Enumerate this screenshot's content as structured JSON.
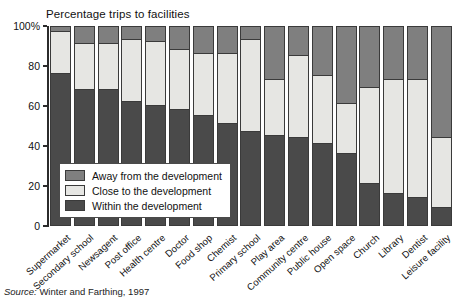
{
  "chart_data": {
    "type": "bar",
    "subtype": "stacked-bar-100-percent",
    "title": "Percentage trips to facilities",
    "xlabel": "",
    "ylabel": "",
    "ylim": [
      0,
      100
    ],
    "yticks": [
      0,
      20,
      40,
      60,
      80,
      100
    ],
    "ytick_labels": [
      "0",
      "20",
      "40",
      "60",
      "80",
      "100%"
    ],
    "grid": false,
    "legend_position": "inside-lower-left",
    "orientation": "vertical",
    "categories": [
      "Supermarket",
      "Secondary school",
      "Newsagent",
      "Post office",
      "Health centre",
      "Doctor",
      "Food shop",
      "Chemist",
      "Primary school",
      "Play area",
      "Community centre",
      "Public house",
      "Open space",
      "Church",
      "Library",
      "Dentist",
      "Leisure facility"
    ],
    "series": [
      {
        "name": "Within the development",
        "color": "#4a4a4a",
        "values": [
          76,
          68,
          68,
          62,
          60,
          58,
          55,
          51,
          47,
          45,
          44,
          41,
          36,
          21,
          16,
          14,
          9
        ]
      },
      {
        "name": "Close to the development",
        "color": "#e6e6e3",
        "values": [
          21,
          23,
          23,
          31,
          32,
          30,
          31,
          35,
          46,
          28,
          41,
          34,
          25,
          48,
          57,
          59,
          35
        ]
      },
      {
        "name": "Away from the development",
        "color": "#7f7f7f",
        "values": [
          3,
          9,
          9,
          7,
          8,
          12,
          14,
          14,
          7,
          27,
          15,
          25,
          39,
          31,
          27,
          27,
          56
        ]
      }
    ]
  },
  "legend": {
    "items": [
      {
        "label": "Away from the development",
        "swatch_class": "sw-away"
      },
      {
        "label": "Close to the development",
        "swatch_class": "sw-close"
      },
      {
        "label": "Within the development",
        "swatch_class": "sw-within"
      }
    ]
  },
  "source_note": {
    "prefix": "Source:",
    "text": "Winter and Farthing, 1997"
  },
  "colors": {
    "away": "#7f7f7f",
    "close": "#e6e6e3",
    "within": "#4a4a4a",
    "axis": "#2b2b2b",
    "text": "#111111",
    "background": "#ffffff"
  }
}
